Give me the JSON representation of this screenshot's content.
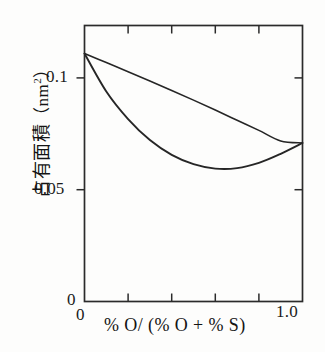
{
  "chart_data": {
    "type": "line",
    "title": "",
    "xlabel": "% O/ (% O + % S)",
    "ylabel_jp": "占有面積",
    "ylabel_unit": "nm",
    "ylabel_unit_exp": "2",
    "ylabel_full": "占有面積（nm2）",
    "xlim": [
      0,
      1.0
    ],
    "ylim": [
      0,
      0.125
    ],
    "grid": false,
    "legend": "none",
    "x_tick_labels": [
      "0",
      "1.0"
    ],
    "x_tick_values": [
      0,
      1.0
    ],
    "x_minor_tick_values": [
      0.2,
      0.4,
      0.6,
      0.8
    ],
    "y_tick_labels": [
      "0",
      "0.05",
      "0.1"
    ],
    "y_tick_values": [
      0,
      0.05,
      0.1
    ],
    "series": [
      {
        "name": "upper-curve",
        "x": [
          0.0,
          0.1,
          0.2,
          0.3,
          0.4,
          0.5,
          0.6,
          0.7,
          0.8,
          0.9,
          1.0
        ],
        "values": [
          0.1123,
          0.1082,
          0.1041,
          0.0999,
          0.0956,
          0.0912,
          0.0867,
          0.0821,
          0.0775,
          0.0727,
          0.0718
        ]
      },
      {
        "name": "lower-curve",
        "x": [
          0.0,
          0.1,
          0.2,
          0.3,
          0.4,
          0.5,
          0.6,
          0.7,
          0.8,
          0.9,
          1.0
        ],
        "values": [
          0.1123,
          0.0951,
          0.0826,
          0.0731,
          0.0664,
          0.0622,
          0.0602,
          0.0604,
          0.0628,
          0.0669,
          0.0718
        ]
      }
    ],
    "annotations": []
  },
  "axis": {
    "xtick_0": "0",
    "xtick_1": "1.0",
    "ytick_0": "0",
    "ytick_005": "0.05",
    "ytick_01": "0.1",
    "xaxis_title": "% O/ (% O + % S)",
    "yaxis_title_jp": "占有面積",
    "yaxis_unit_open": "（nm",
    "yaxis_unit_exp": "2",
    "yaxis_unit_close": "）"
  },
  "style": {
    "line_color": "#262626",
    "axis_color": "#2b2b2b",
    "background": "#fdfdfc",
    "text_color": "#141414"
  }
}
